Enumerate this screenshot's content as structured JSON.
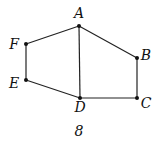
{
  "diagram": {
    "caption": "8",
    "points": {
      "A": {
        "label": "A",
        "x": 79,
        "y": 26,
        "lx": 79,
        "ly": 18
      },
      "B": {
        "label": "B",
        "x": 137,
        "y": 58,
        "lx": 146,
        "ly": 60
      },
      "C": {
        "label": "C",
        "x": 137,
        "y": 98,
        "lx": 146,
        "ly": 108
      },
      "D": {
        "label": "D",
        "x": 80,
        "y": 98,
        "lx": 80,
        "ly": 112
      },
      "E": {
        "label": "E",
        "x": 26,
        "y": 80,
        "lx": 14,
        "ly": 88
      },
      "F": {
        "label": "F",
        "x": 26,
        "y": 44,
        "lx": 14,
        "ly": 49
      }
    },
    "edges": [
      [
        "A",
        "B"
      ],
      [
        "B",
        "C"
      ],
      [
        "C",
        "D"
      ],
      [
        "D",
        "E"
      ],
      [
        "E",
        "F"
      ],
      [
        "F",
        "A"
      ],
      [
        "A",
        "D"
      ]
    ]
  }
}
